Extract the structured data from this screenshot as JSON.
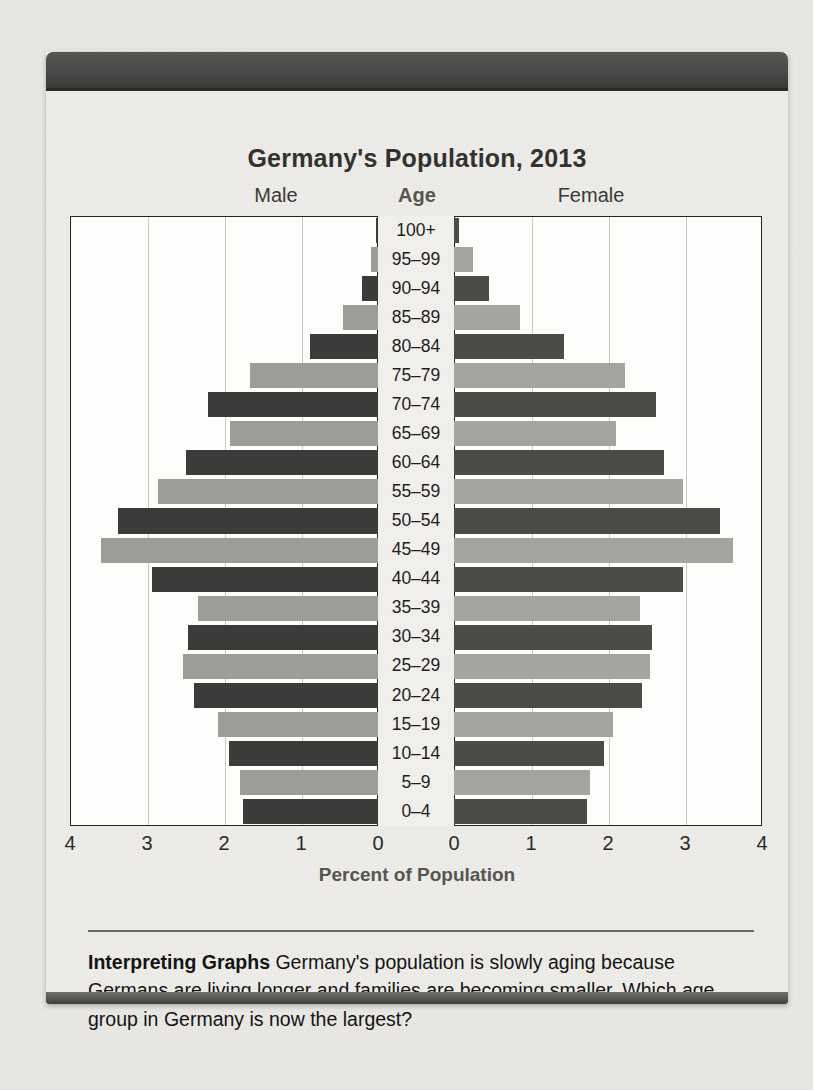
{
  "chart_data": {
    "type": "bar",
    "subtype": "population-pyramid",
    "title": "Germany's Population, 2013",
    "xlabel": "Percent of Population",
    "ylabel": "Age",
    "grid": true,
    "legend_position": "top",
    "xlim_left": [
      4,
      0
    ],
    "xlim_right": [
      0,
      4
    ],
    "xticks_left": [
      "4",
      "3",
      "2",
      "1",
      "0"
    ],
    "xticks_right": [
      "0",
      "1",
      "2",
      "3",
      "4"
    ],
    "side_labels": {
      "left": "Male",
      "center": "Age",
      "right": "Female"
    },
    "categories": [
      "100+",
      "95–99",
      "90–94",
      "85–89",
      "80–84",
      "75–79",
      "70–74",
      "65–69",
      "60–64",
      "55–59",
      "50–54",
      "45–49",
      "40–44",
      "35–39",
      "30–34",
      "25–29",
      "20–24",
      "15–19",
      "10–14",
      "5–9",
      "0–4"
    ],
    "series": [
      {
        "name": "Male",
        "values": [
          0.02,
          0.09,
          0.21,
          0.46,
          0.88,
          1.66,
          2.21,
          1.92,
          2.5,
          2.86,
          3.38,
          3.6,
          2.94,
          2.34,
          2.47,
          2.53,
          2.39,
          2.08,
          1.94,
          1.79,
          1.75
        ]
      },
      {
        "name": "Female",
        "values": [
          0.07,
          0.25,
          0.46,
          0.86,
          1.43,
          2.22,
          2.62,
          2.1,
          2.73,
          2.97,
          3.46,
          3.62,
          2.97,
          2.42,
          2.57,
          2.55,
          2.44,
          2.06,
          1.95,
          1.77,
          1.73
        ]
      }
    ],
    "bar_fill_pattern": "alternating dark / light gray by age band",
    "colors": {
      "bar_dark": "#3c3b39",
      "bar_light": "#9d9c98",
      "bar_dark_female": "#4c4b48",
      "bar_light_female": "#a5a4a0",
      "plot_background": "#fdfdfb",
      "gridline": "#c9c8c4",
      "axis": "#262524",
      "page": "#edece8",
      "accent_heading": "#56554f"
    }
  },
  "caption": {
    "label": "Interpreting Graphs",
    "text": "Germany's population is slowly aging because Germans are living longer and families are becoming smaller. Which age group in Germany is now the largest?"
  }
}
